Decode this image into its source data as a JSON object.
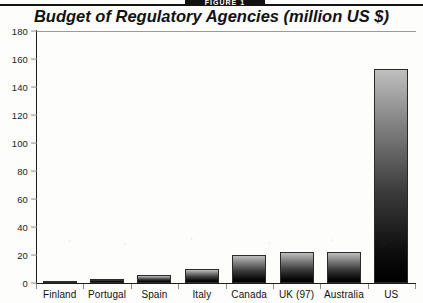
{
  "figure": {
    "banner_label": "FIGURE 1",
    "title": "Budget of Regulatory Agencies (million US $)"
  },
  "chart_data": {
    "type": "bar",
    "title": "Budget of Regulatory Agencies (million US $)",
    "xlabel": "",
    "ylabel": "",
    "ylim": [
      0,
      180
    ],
    "yticks": [
      0,
      20,
      40,
      60,
      80,
      100,
      120,
      140,
      160,
      180
    ],
    "ytick_labels": [
      "0",
      "20",
      "40",
      "60",
      "80",
      "100",
      "120",
      "140",
      "160",
      "180"
    ],
    "grid": false,
    "legend": false,
    "units": "million US $",
    "categories": [
      "Finland",
      "Portugal",
      "Spain",
      "Italy",
      "Canada",
      "UK (97)",
      "Australia",
      "US"
    ],
    "values": [
      1,
      3,
      6,
      10,
      20,
      22,
      22,
      153
    ],
    "bar_fill": "vertical-gradient-light-top-to-black-bottom",
    "colors": {
      "bar_top": "#bfbfbf",
      "bar_bottom": "#000000",
      "axis": "#1b1b1b",
      "tick": "#8d8d8d",
      "text": "#111111",
      "background": "#fdfdfc"
    }
  }
}
